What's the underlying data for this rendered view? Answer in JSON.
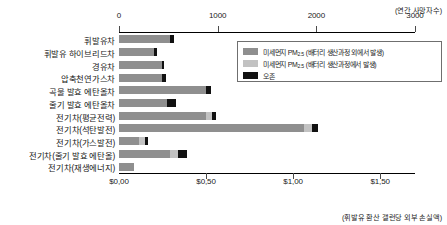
{
  "chart_data": {
    "type": "bar",
    "orientation": "horizontal",
    "stacked": true,
    "title": "",
    "top_axis_note": "(연간 사망자수)",
    "bottom_axis_note": "(휘발유 환산 갤런당 외부 손실액)",
    "categories": [
      "휘발유차",
      "휘발유 하이브리드차",
      "경유차",
      "압축천연가스차",
      "곡물 발효 에탄올차",
      "줄기 발효 에탄올차",
      "전기차(평균전력)",
      "전기차(석탄발전)",
      "전기차(가스발전)",
      "전기차(줄기 발효 에탄올)",
      "전기차(재생에너지)"
    ],
    "series": [
      {
        "name": "미세먼지 PM2.5 (배터리 생산과정 외에서 발생)",
        "color": "#8f8f8f",
        "values": [
          520,
          350,
          440,
          440,
          880,
          490,
          880,
          1880,
          200,
          520,
          150
        ]
      },
      {
        "name": "미세먼지 PM2.5 (배터리 생산과정에서 발생)",
        "color": "#c2c2c2",
        "values": [
          0,
          0,
          0,
          0,
          0,
          0,
          60,
          80,
          60,
          80,
          0
        ]
      },
      {
        "name": "오존",
        "color": "#111111",
        "values": [
          40,
          40,
          20,
          40,
          50,
          90,
          40,
          60,
          30,
          90,
          0
        ]
      }
    ],
    "top_axis": {
      "label": "연간 사망자수",
      "ticks": [
        0,
        1000,
        2000,
        3000
      ],
      "tick_labels": [
        "0",
        "1000",
        "2000",
        "3000"
      ],
      "min": 0,
      "max": 3000
    },
    "bottom_axis": {
      "label": "휘발유 환산 갤런당 외부 손실액",
      "ticks": [
        0,
        0.5,
        1.0,
        1.5
      ],
      "tick_labels": [
        "$0,00",
        "$0,50",
        "$1,00",
        "$1,50"
      ],
      "min": 0,
      "max": 1.7
    },
    "grid": false,
    "legend_position": "top-right"
  },
  "legend": {
    "items": [
      {
        "label_main": "미세먼지 PM",
        "label_sub": "2.5",
        "label_rest": " (배터리 생산과정 외에서 발생)",
        "color": "#8f8f8f",
        "swatch_name": "legend-swatch-pm25-non-battery"
      },
      {
        "label_main": "미세먼지 PM",
        "label_sub": "2.5",
        "label_rest": " (배터리 생산과정에서 발생)",
        "color": "#c2c2c2",
        "swatch_name": "legend-swatch-pm25-battery"
      },
      {
        "label_main": "오존",
        "label_sub": "",
        "label_rest": "",
        "color": "#111111",
        "swatch_name": "legend-swatch-ozone"
      }
    ]
  }
}
